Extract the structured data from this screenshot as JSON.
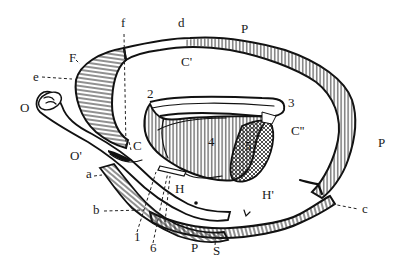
{
  "figure": {
    "type": "anatomical-line-drawing",
    "background": "#ffffff",
    "ink_color": "#111111",
    "labels": [
      {
        "id": "f",
        "text": "f",
        "x": 121,
        "y": 27
      },
      {
        "id": "d",
        "text": "d",
        "x": 178,
        "y": 27
      },
      {
        "id": "P_top",
        "text": "P",
        "x": 241,
        "y": 33
      },
      {
        "id": "F",
        "text": "F",
        "x": 69,
        "y": 62
      },
      {
        "id": "C_prime",
        "text": "C'",
        "x": 181,
        "y": 66
      },
      {
        "id": "e",
        "text": "e",
        "x": 33,
        "y": 81
      },
      {
        "id": "O",
        "text": "O",
        "x": 20,
        "y": 112
      },
      {
        "id": "2",
        "text": "2",
        "x": 147,
        "y": 98
      },
      {
        "id": "3",
        "text": "3",
        "x": 288,
        "y": 107
      },
      {
        "id": "4",
        "text": "4",
        "x": 208,
        "y": 146
      },
      {
        "id": "5",
        "text": "5",
        "x": 245,
        "y": 150
      },
      {
        "id": "C_double_prime",
        "text": "C''",
        "x": 291,
        "y": 135
      },
      {
        "id": "P_right",
        "text": "P",
        "x": 378,
        "y": 147
      },
      {
        "id": "C",
        "text": "C",
        "x": 133,
        "y": 150
      },
      {
        "id": "O_prime",
        "text": "O'",
        "x": 70,
        "y": 160
      },
      {
        "id": "a",
        "text": "a",
        "x": 86,
        "y": 178
      },
      {
        "id": "H",
        "text": "H",
        "x": 175,
        "y": 193
      },
      {
        "id": "H_prime",
        "text": "H'",
        "x": 262,
        "y": 199
      },
      {
        "id": "b",
        "text": "b",
        "x": 93,
        "y": 214
      },
      {
        "id": "c",
        "text": "c",
        "x": 362,
        "y": 213
      },
      {
        "id": "1",
        "text": "1",
        "x": 134,
        "y": 241
      },
      {
        "id": "6",
        "text": "6",
        "x": 150,
        "y": 252
      },
      {
        "id": "P_bottom",
        "text": "P",
        "x": 191,
        "y": 252
      },
      {
        "id": "S",
        "text": "S",
        "x": 213,
        "y": 255
      }
    ]
  }
}
